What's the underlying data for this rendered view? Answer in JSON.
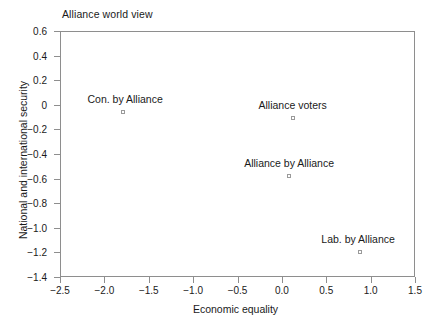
{
  "chart_data": {
    "type": "scatter",
    "title": "Alliance world view",
    "xlabel": "Economic equality",
    "ylabel": "National and international security",
    "xlim": [
      -2.5,
      1.5
    ],
    "ylim": [
      -1.4,
      0.6
    ],
    "grid": false,
    "legend": "none",
    "marker": "open-square",
    "xticks": [
      {
        "value": -2.5,
        "label": "−2.5"
      },
      {
        "value": -2.0,
        "label": "−2.0"
      },
      {
        "value": -1.5,
        "label": "−1.5"
      },
      {
        "value": -1.0,
        "label": "−1.0"
      },
      {
        "value": -0.5,
        "label": "−0.5"
      },
      {
        "value": 0.0,
        "label": "0.0"
      },
      {
        "value": 0.5,
        "label": "0.5"
      },
      {
        "value": 1.0,
        "label": "1.0"
      },
      {
        "value": 1.5,
        "label": "1.5"
      }
    ],
    "yticks": [
      {
        "value": 0.6,
        "label": "0.6"
      },
      {
        "value": 0.4,
        "label": "0.4"
      },
      {
        "value": 0.2,
        "label": "0.2"
      },
      {
        "value": 0.0,
        "label": "0"
      },
      {
        "value": -0.2,
        "label": "−0.2"
      },
      {
        "value": -0.4,
        "label": "−0.4"
      },
      {
        "value": -0.6,
        "label": "−0.6"
      },
      {
        "value": -0.8,
        "label": "−0.8"
      },
      {
        "value": -1.0,
        "label": "−1.0"
      },
      {
        "value": -1.2,
        "label": "−1.2"
      },
      {
        "value": -1.4,
        "label": "−1.4"
      }
    ],
    "points": [
      {
        "label": "Con. by Alliance",
        "x": -1.8,
        "y": -0.05,
        "label_dx": 2,
        "label_dy": -7
      },
      {
        "label": "Alliance voters",
        "x": 0.11,
        "y": -0.1,
        "label_dx": 0,
        "label_dy": -7
      },
      {
        "label": "Alliance by Alliance",
        "x": 0.07,
        "y": -0.57,
        "label_dx": 0,
        "label_dy": -7
      },
      {
        "label": "Lab. by Alliance",
        "x": 0.87,
        "y": -1.19,
        "label_dx": -2,
        "label_dy": -7
      }
    ]
  },
  "colors": {
    "axis": "#8e8e8e",
    "text": "#1a1a1a",
    "marker_outline": "#9a9a9a",
    "background": "#ffffff"
  }
}
